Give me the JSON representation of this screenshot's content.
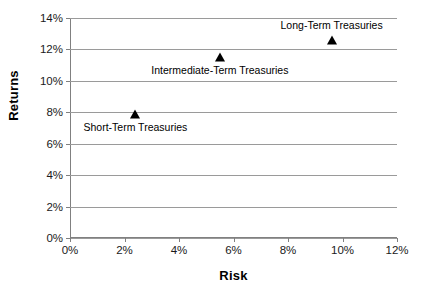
{
  "chart_data": {
    "type": "scatter",
    "title": "",
    "xlabel": "Risk",
    "ylabel": "Returns",
    "xlim": [
      0,
      12
    ],
    "ylim": [
      0,
      14
    ],
    "xticks": [
      "0%",
      "2%",
      "4%",
      "6%",
      "8%",
      "10%",
      "12%"
    ],
    "xtick_values": [
      0,
      2,
      4,
      6,
      8,
      10,
      12
    ],
    "yticks": [
      "0%",
      "2%",
      "4%",
      "6%",
      "8%",
      "10%",
      "12%",
      "14%"
    ],
    "ytick_values": [
      0,
      2,
      4,
      6,
      8,
      10,
      12,
      14
    ],
    "grid": "horizontal",
    "legend": "none",
    "marker_shape": "triangle",
    "marker_color": "#000000",
    "gridline_color": "#9a9a9a",
    "axis_color": "#808080",
    "background": "#ffffff",
    "points": [
      {
        "label": "Short-Term Treasuries",
        "x": 2.4,
        "y": 7.9,
        "label_position": "below"
      },
      {
        "label": "Intermediate-Term Treasuries",
        "x": 5.5,
        "y": 11.5,
        "label_position": "below"
      },
      {
        "label": "Long-Term Treasuries",
        "x": 9.6,
        "y": 12.6,
        "label_position": "above"
      }
    ]
  }
}
